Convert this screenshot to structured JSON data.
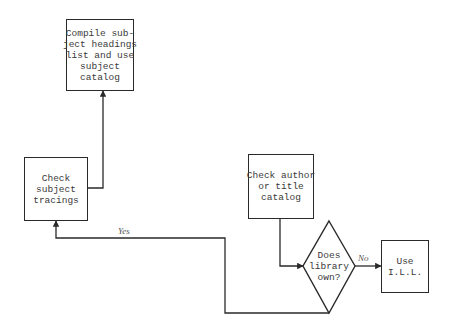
{
  "nodes": {
    "compile": {
      "lines": [
        "Compile sub-",
        "ject headings",
        "list and use",
        "subject",
        "catalog"
      ]
    },
    "subject_tracings": {
      "lines": [
        "Check",
        "subject",
        "tracings"
      ]
    },
    "author_title": {
      "lines": [
        "Check author",
        "or title",
        "catalog"
      ]
    },
    "decision": {
      "lines": [
        "Does",
        "library",
        "own?"
      ]
    },
    "ill": {
      "lines": [
        "Use",
        "I.L.L."
      ]
    }
  },
  "edges": {
    "yes_label": "Yes",
    "no_label": "No"
  },
  "colors": {
    "stroke": "#2a2a2a",
    "text": "#3a3a3a",
    "background": "#ffffff"
  }
}
